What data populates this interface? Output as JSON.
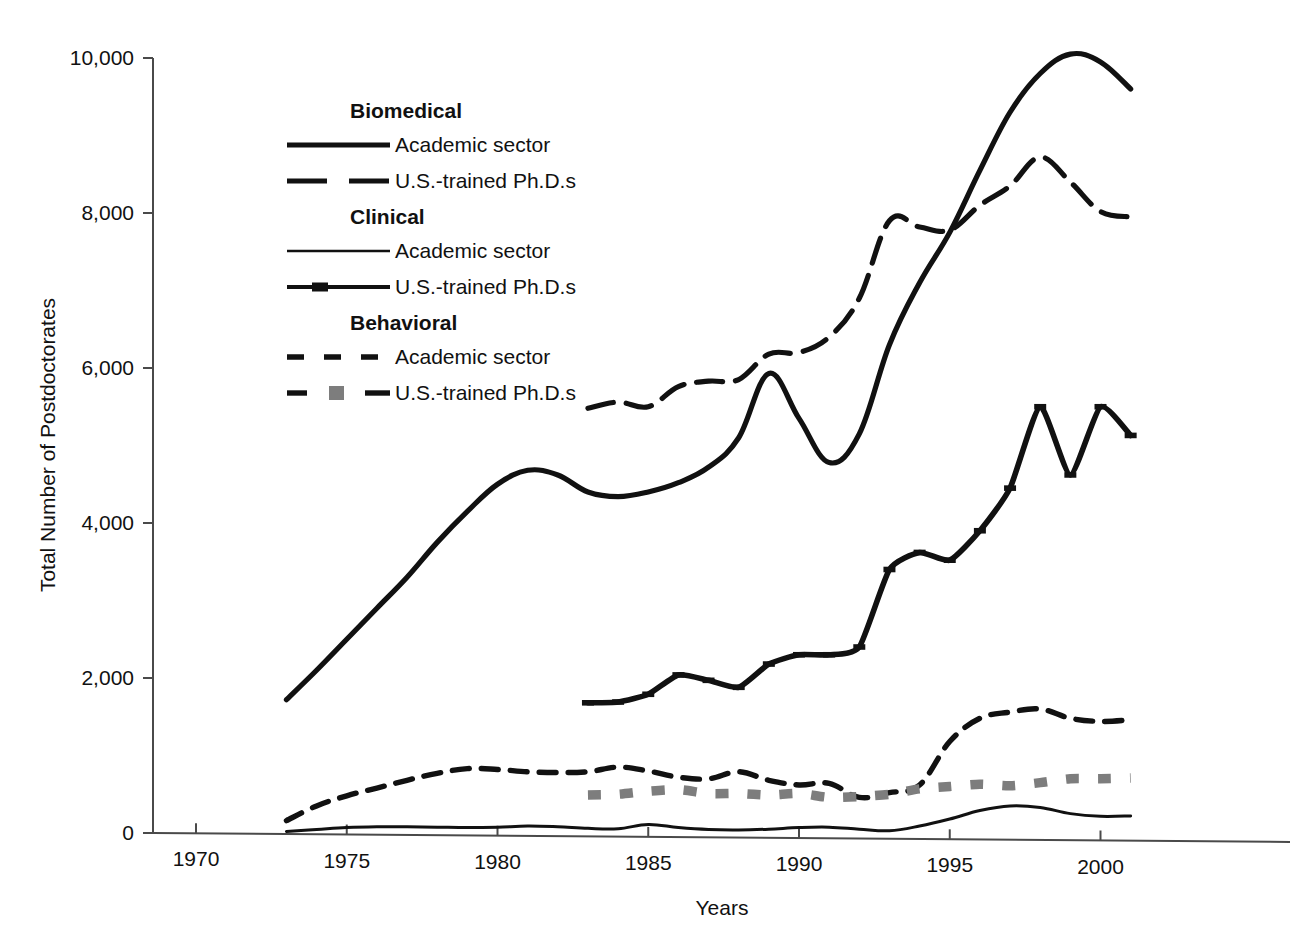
{
  "chart_data": {
    "type": "line",
    "title": "",
    "xlabel": "Years",
    "ylabel": "Total Number of Postdoctorates",
    "xlim": [
      1970,
      2001.5
    ],
    "ylim": [
      0,
      10000
    ],
    "grid": false,
    "legend_position": "upper-left-inside",
    "xticks": [
      "1970",
      "1975",
      "1980",
      "1985",
      "1990",
      "1995",
      "2000"
    ],
    "xtick_values": [
      1970,
      1975,
      1980,
      1985,
      1990,
      1995,
      2000
    ],
    "yticks": [
      "0",
      "2,000",
      "4,000",
      "6,000",
      "8,000",
      "10,000"
    ],
    "ytick_values": [
      0,
      2000,
      4000,
      6000,
      8000,
      10000
    ],
    "legend_groups": [
      {
        "heading": "Biomedical",
        "entries": [
          {
            "label": "Academic sector",
            "style": "solid-thick"
          },
          {
            "label": "U.S.-trained Ph.D.s",
            "style": "dashed-thick"
          }
        ]
      },
      {
        "heading": "Clinical",
        "entries": [
          {
            "label": "Academic sector",
            "style": "solid-thin"
          },
          {
            "label": "U.S.-trained Ph.D.s",
            "style": "solid-thick-marker"
          }
        ]
      },
      {
        "heading": "Behavioral",
        "entries": [
          {
            "label": "Academic sector",
            "style": "dashed-short"
          },
          {
            "label": "U.S.-trained Ph.D.s",
            "style": "dashed-gray-square"
          }
        ]
      }
    ],
    "series": [
      {
        "name": "Biomedical Academic sector",
        "group": "Biomedical",
        "style": "solid-thick",
        "x": [
          1973,
          1974,
          1975,
          1976,
          1977,
          1978,
          1979,
          1980,
          1981,
          1982,
          1983,
          1984,
          1985,
          1986,
          1987,
          1988,
          1989,
          1990,
          1991,
          1992,
          1993,
          1994,
          1995,
          1996,
          1997,
          1998,
          1999,
          2000,
          2001
        ],
        "values": [
          1720,
          2100,
          2500,
          2900,
          3300,
          3750,
          4150,
          4500,
          4680,
          4620,
          4400,
          4340,
          4400,
          4520,
          4720,
          5100,
          5930,
          5350,
          4780,
          5150,
          6300,
          7100,
          7750,
          8550,
          9300,
          9800,
          10050,
          9950,
          9600
        ]
      },
      {
        "name": "Biomedical U.S.-trained Ph.D.s",
        "group": "Biomedical",
        "style": "dashed-thick",
        "x": [
          1983,
          1984,
          1985,
          1986,
          1987,
          1988,
          1989,
          1990,
          1991,
          1992,
          1993,
          1994,
          1995,
          1996,
          1997,
          1998,
          1999,
          2000,
          2001
        ],
        "values": [
          5480,
          5560,
          5500,
          5760,
          5830,
          5850,
          6180,
          6200,
          6400,
          6900,
          7900,
          7820,
          7780,
          8100,
          8350,
          8720,
          8400,
          8020,
          7950
        ]
      },
      {
        "name": "Clinical Academic sector",
        "group": "Clinical",
        "style": "solid-thin",
        "x": [
          1973,
          1974,
          1975,
          1976,
          1977,
          1978,
          1979,
          1980,
          1981,
          1982,
          1983,
          1984,
          1985,
          1986,
          1987,
          1988,
          1989,
          1990,
          1991,
          1992,
          1993,
          1994,
          1995,
          1996,
          1997,
          1998,
          1999,
          2000,
          2001
        ],
        "values": [
          20,
          45,
          70,
          80,
          80,
          75,
          70,
          75,
          90,
          80,
          60,
          55,
          110,
          70,
          45,
          40,
          50,
          70,
          75,
          50,
          30,
          90,
          180,
          290,
          350,
          330,
          250,
          215,
          220
        ]
      },
      {
        "name": "Clinical U.S.-trained Ph.D.s",
        "group": "Clinical",
        "style": "solid-thick-marker",
        "x": [
          1983,
          1984,
          1985,
          1986,
          1987,
          1988,
          1989,
          1990,
          1991,
          1992,
          1993,
          1994,
          1995,
          1996,
          1997,
          1998,
          1999,
          2000,
          2001
        ],
        "values": [
          1680,
          1690,
          1790,
          2040,
          1970,
          1880,
          2180,
          2300,
          2300,
          2400,
          3400,
          3620,
          3520,
          3900,
          4450,
          5500,
          4620,
          5500,
          5130
        ]
      },
      {
        "name": "Behavioral Academic sector",
        "group": "Behavioral",
        "style": "dashed-short",
        "x": [
          1973,
          1974,
          1975,
          1976,
          1977,
          1978,
          1979,
          1980,
          1981,
          1982,
          1983,
          1984,
          1985,
          1986,
          1987,
          1988,
          1989,
          1990,
          1991,
          1992,
          1993,
          1994,
          1995,
          1996,
          1997,
          1998,
          1999,
          2000,
          2001
        ],
        "values": [
          160,
          350,
          480,
          580,
          680,
          770,
          830,
          820,
          790,
          780,
          790,
          850,
          800,
          720,
          700,
          790,
          680,
          620,
          640,
          460,
          520,
          620,
          1180,
          1480,
          1560,
          1600,
          1480,
          1440,
          1460
        ]
      },
      {
        "name": "Behavioral U.S.-trained Ph.D.s",
        "group": "Behavioral",
        "style": "dashed-gray-square",
        "x": [
          1983,
          1984,
          1985,
          1986,
          1987,
          1988,
          1989,
          1990,
          1991,
          1992,
          1993,
          1994,
          1995,
          1996,
          1997,
          1998,
          1999,
          2000,
          2001
        ],
        "values": [
          490,
          500,
          540,
          560,
          510,
          510,
          490,
          510,
          460,
          470,
          500,
          570,
          600,
          630,
          610,
          650,
          700,
          700,
          710
        ]
      }
    ]
  },
  "colors": {
    "ink": "#111111",
    "axis": "#4a4a4a",
    "gray_marker": "#7d7d7d",
    "background": "#ffffff"
  }
}
